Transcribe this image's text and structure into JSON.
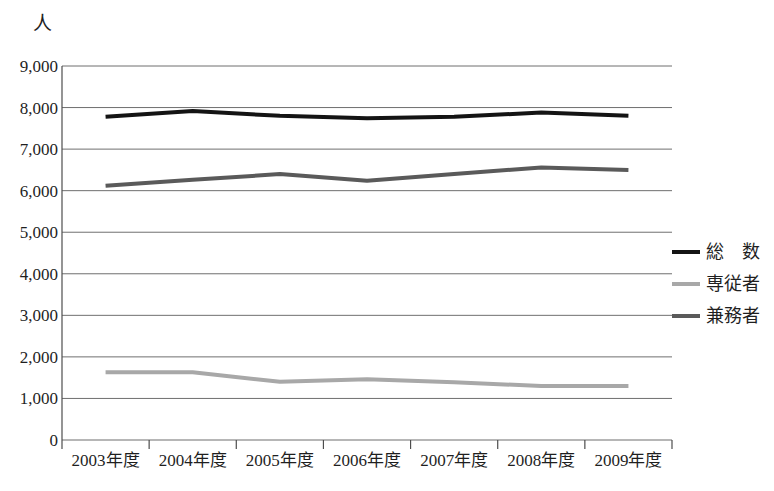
{
  "chart_data": {
    "type": "line",
    "title": "",
    "subtitle": "",
    "unit_label": "人",
    "xlabel": "",
    "ylabel": "",
    "categories": [
      "2003年度",
      "2004年度",
      "2005年度",
      "2006年度",
      "2007年度",
      "2008年度",
      "2009年度"
    ],
    "ylim": [
      0,
      9000
    ],
    "ytick_values": [
      9000,
      8000,
      7000,
      6000,
      5000,
      4000,
      3000,
      2000,
      1000,
      0
    ],
    "ytick_labels": [
      "9,000",
      "8,000",
      "7,000",
      "6,000",
      "5,000",
      "4,000",
      "3,000",
      "2,000",
      "1,000",
      "0"
    ],
    "grid": true,
    "grid_axis": "y",
    "legend_position": "right",
    "series": [
      {
        "name": "総　数",
        "key": "total",
        "color": "#141414",
        "width": 4,
        "values": [
          7780,
          7920,
          7800,
          7740,
          7780,
          7880,
          7800
        ]
      },
      {
        "name": "専従者",
        "key": "fulltime",
        "color": "#a8a8a8",
        "width": 4,
        "values": [
          1630,
          1630,
          1400,
          1460,
          1390,
          1300,
          1300
        ]
      },
      {
        "name": "兼務者",
        "key": "concurrent",
        "color": "#5a5a5a",
        "width": 4,
        "values": [
          6120,
          6260,
          6400,
          6240,
          6400,
          6560,
          6500
        ]
      }
    ]
  },
  "axes": {
    "axis_color": "#4d4d4d",
    "grid_color": "#6f6f6f",
    "plot_left": 62,
    "plot_right": 672,
    "plot_top": 66,
    "plot_bottom": 440
  }
}
